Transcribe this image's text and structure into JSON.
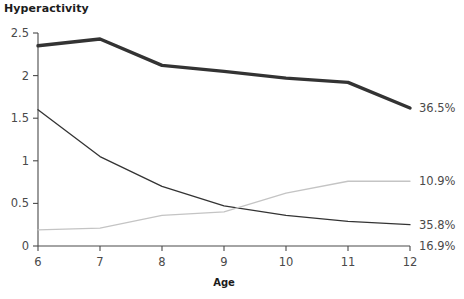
{
  "chart_data": {
    "type": "line",
    "title": "Hyperactivity",
    "xlabel": "Age",
    "ylabel": "",
    "x": [
      6,
      7,
      8,
      9,
      10,
      11,
      12
    ],
    "xlim": [
      6,
      12
    ],
    "ylim": [
      0,
      2.5
    ],
    "grid": false,
    "legend_position": "right-end-labels",
    "xticks": [
      "6",
      "7",
      "8",
      "9",
      "10",
      "11",
      "12"
    ],
    "yticks": [
      "0",
      "0.5",
      "1",
      "1.5",
      "2",
      "2.5"
    ],
    "ytick_values": [
      0,
      0.5,
      1,
      1.5,
      2,
      2.5
    ],
    "series": [
      {
        "name": "36.5%",
        "end_label": "36.5%",
        "color": "#333333",
        "width": 3.4,
        "values": [
          2.35,
          2.43,
          2.12,
          2.05,
          1.97,
          1.92,
          1.62
        ]
      },
      {
        "name": "35.8%",
        "end_label": "35.8%",
        "color": "#333333",
        "width": 1.3,
        "values": [
          1.6,
          1.05,
          0.7,
          0.47,
          0.36,
          0.29,
          0.25
        ]
      },
      {
        "name": "10.9%",
        "end_label": "10.9%",
        "color": "#c4c4c4",
        "width": 1.3,
        "values": [
          0.19,
          0.21,
          0.36,
          0.4,
          0.62,
          0.76,
          0.76
        ]
      },
      {
        "name": "16.9%",
        "end_label": "16.9%",
        "color": "#333333",
        "width": 1.3,
        "values": [
          0.0,
          0.0,
          0.0,
          0.0,
          0.0,
          0.0,
          0.0
        ]
      }
    ]
  },
  "axis": {
    "title": "Hyperactivity",
    "x_axis_title": "Age",
    "y_ticks": [
      {
        "label": "2.5",
        "value": 2.5
      },
      {
        "label": "2",
        "value": 2
      },
      {
        "label": "1.5",
        "value": 1.5
      },
      {
        "label": "1",
        "value": 1
      },
      {
        "label": "0.5",
        "value": 0.5
      },
      {
        "label": "0",
        "value": 0
      }
    ],
    "x_ticks": [
      {
        "label": "6",
        "value": 6
      },
      {
        "label": "7",
        "value": 7
      },
      {
        "label": "8",
        "value": 8
      },
      {
        "label": "9",
        "value": 9
      },
      {
        "label": "10",
        "value": 10
      },
      {
        "label": "11",
        "value": 11
      },
      {
        "label": "12",
        "value": 12
      }
    ],
    "axis_color": "#4a4a4a"
  },
  "end_labels": [
    {
      "text": "36.5%",
      "value": 1.62
    },
    {
      "text": "10.9%",
      "value": 0.76
    },
    {
      "text": "35.8%",
      "value": 0.25
    },
    {
      "text": "16.9%",
      "value": 0.0
    }
  ]
}
